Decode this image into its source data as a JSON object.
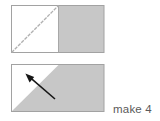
{
  "figure": {
    "caption": "make 4",
    "colors": {
      "fabric_gray": "#c7c7c7",
      "fabric_white": "#ffffff",
      "outline": "#9a9a9a",
      "fold_line": "#b5b5b5",
      "arrow": "#1a1a1a",
      "caption_text": "#5a5a5a"
    },
    "steps": [
      {
        "id": "step-1",
        "label": "rectangle with white left square and gray right square, dashed diagonal fold line",
        "rect": {
          "x": 11,
          "y": 5,
          "width": 93,
          "height": 48
        },
        "divider_x": 58,
        "left_fill": "#ffffff",
        "right_fill": "#c7c7c7",
        "fold_line": {
          "style": "dashed",
          "from": {
            "x": 12,
            "y": 52
          },
          "to": {
            "x": 58,
            "y": 6
          }
        }
      },
      {
        "id": "step-2",
        "label": "same rectangle with gray triangle folded over diagonal and arrow showing fold direction",
        "rect": {
          "x": 11,
          "y": 64,
          "width": 93,
          "height": 48
        },
        "gray_polygon": [
          {
            "x": 11,
            "y": 112
          },
          {
            "x": 59,
            "y": 64
          },
          {
            "x": 104,
            "y": 64
          },
          {
            "x": 104,
            "y": 112
          }
        ],
        "white_polygon": [
          {
            "x": 11,
            "y": 64
          },
          {
            "x": 59,
            "y": 64
          },
          {
            "x": 11,
            "y": 112
          }
        ],
        "arrow": {
          "tail": {
            "x": 55,
            "y": 99
          },
          "head": {
            "x": 26,
            "y": 74
          },
          "direction": "up-left"
        }
      }
    ]
  }
}
